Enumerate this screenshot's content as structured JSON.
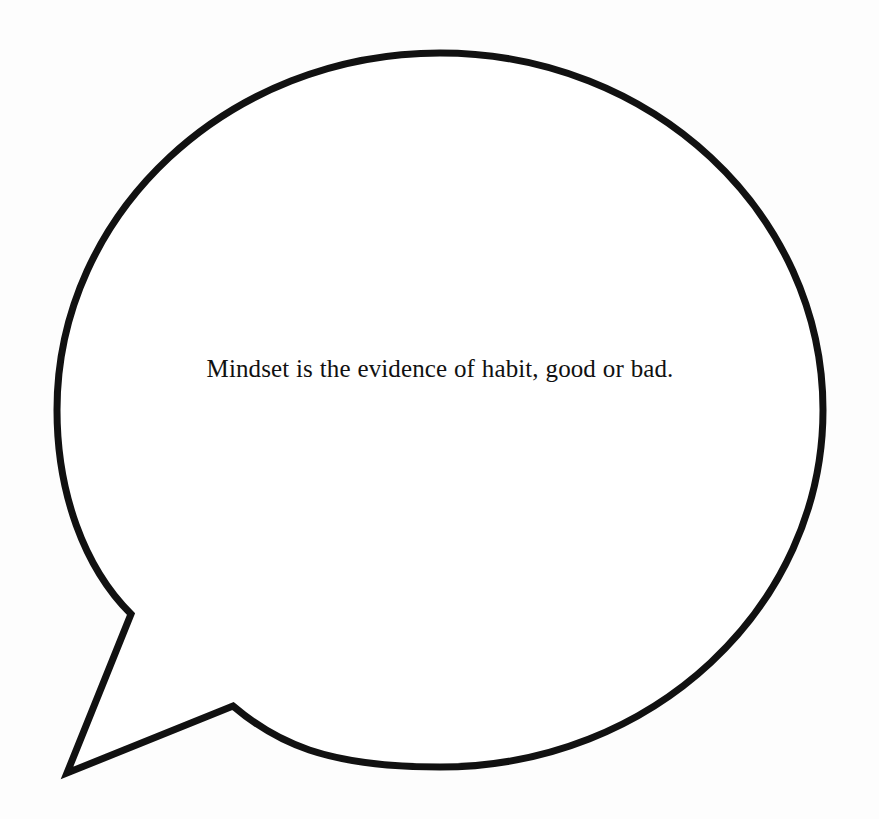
{
  "canvas": {
    "width": 879,
    "height": 819,
    "background_color": "#fdfdfd"
  },
  "bubble": {
    "name": "speech-bubble",
    "shape": "ellipse-with-pointed-tail",
    "fill_color": "#ffffff",
    "stroke_color": "#111111",
    "stroke_width": 7,
    "ellipse": {
      "center_x": 440,
      "center_y": 410,
      "radius_x": 383,
      "radius_y": 357
    },
    "tail": {
      "name": "speech-bubble-tail",
      "attach_upper_x": 131,
      "attach_upper_y": 614,
      "tip_x": 67,
      "tip_y": 773,
      "attach_lower_x": 233,
      "attach_lower_y": 706
    }
  },
  "quote": {
    "text": "Mindset is the evidence of habit, good or bad.",
    "lines": [
      "Mindset is the evidence of habit, good or",
      "bad."
    ],
    "text_color": "#111111",
    "font_size_px": 25,
    "align": "center"
  }
}
